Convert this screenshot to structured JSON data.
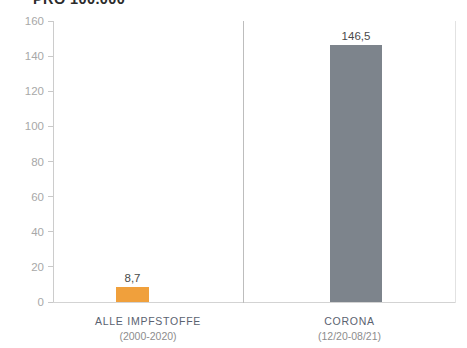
{
  "chart_data": {
    "type": "bar",
    "title": "PRO 100.000",
    "xlabel": "",
    "ylabel": "",
    "ylim": [
      0,
      160
    ],
    "ytick_step": 20,
    "yticks": [
      0,
      20,
      40,
      60,
      80,
      100,
      120,
      140,
      160
    ],
    "ytick_labels": [
      "0",
      "20",
      "40",
      "60",
      "80",
      "100",
      "120",
      "140",
      "160"
    ],
    "grid": false,
    "legend": "none",
    "categories": [
      "ALLE IMPFSTOFFE",
      "CORONA"
    ],
    "category_sublabels": [
      "(2000-2020)",
      "(12/20-08/21)"
    ],
    "values": [
      8.7,
      146.5
    ],
    "value_labels": [
      "8,7",
      "146,5"
    ],
    "colors": [
      "#f0a03c",
      "#7d848c"
    ],
    "series": [
      {
        "name": "Meldungen pro 100.000",
        "values": [
          8.7,
          146.5
        ]
      }
    ],
    "points": [
      {
        "category": "ALLE IMPFSTOFFE",
        "sublabel": "(2000-2020)",
        "value": 8.7,
        "value_label": "8,7",
        "color": "#f0a03c"
      },
      {
        "category": "CORONA",
        "sublabel": "(12/20-08/21)",
        "value": 146.5,
        "value_label": "146,5",
        "color": "#7d848c"
      }
    ]
  },
  "axis": {
    "y_tick_color": "#a8a8a8",
    "axis_line_color": "#cccccc",
    "divider_color": "#bdbdbd"
  },
  "theme": {
    "background": "#ffffff",
    "accent_orange": "#f0a03c",
    "accent_gray": "#7d848c",
    "title_color": "#2b2b2b",
    "category_label_color": "#5a6270",
    "sublabel_color": "#8d8d8d"
  }
}
